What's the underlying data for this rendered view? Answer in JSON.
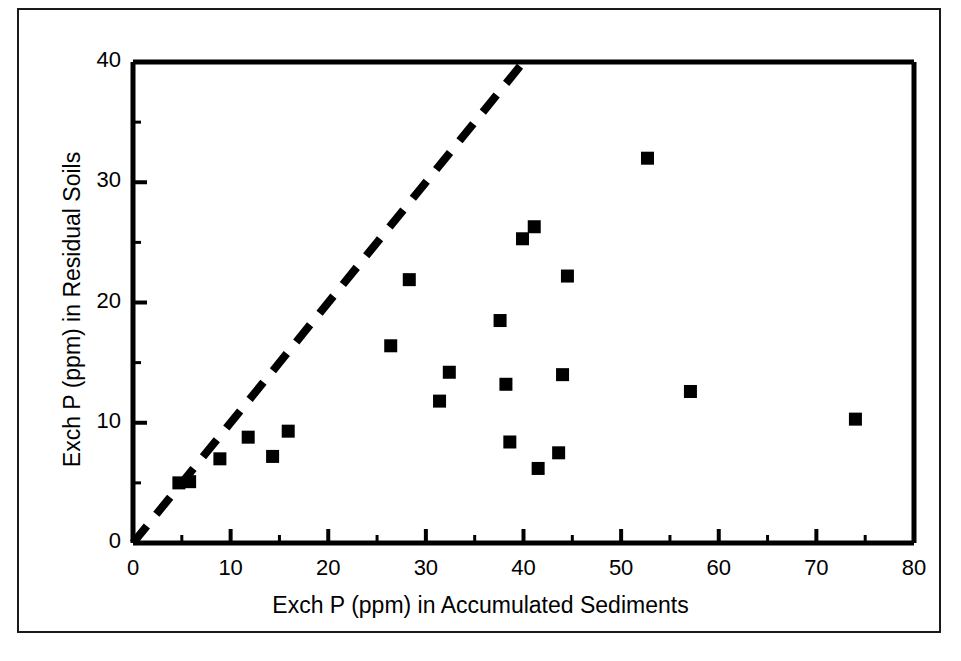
{
  "figure": {
    "background_color": "#ffffff",
    "ink_color": "#000000",
    "border_color": "#1a1a1a"
  },
  "chart_data": {
    "type": "scatter",
    "title": "",
    "xlabel": "Exch P (ppm) in Accumulated Sediments",
    "ylabel": "Exch P (ppm) in Residual Soils",
    "xlim": [
      0,
      80
    ],
    "ylim": [
      0,
      40
    ],
    "grid": false,
    "legend": null,
    "xticks": [
      0,
      10,
      20,
      30,
      40,
      50,
      60,
      70,
      80
    ],
    "xtick_labels": [
      "0",
      "10",
      "20",
      "30",
      "40",
      "50",
      "60",
      "70",
      "80"
    ],
    "x_minor_ticks": [
      5,
      15,
      25,
      35,
      45,
      55,
      65,
      75
    ],
    "yticks": [
      0,
      10,
      20,
      30,
      40
    ],
    "ytick_labels": [
      "0",
      "10",
      "20",
      "30",
      "40"
    ],
    "y_minor_ticks": [
      5,
      15,
      25,
      35
    ],
    "marker": "filled-square",
    "marker_color": "#000000",
    "points": [
      {
        "x": 4.7,
        "y": 5.0
      },
      {
        "x": 5.8,
        "y": 5.1
      },
      {
        "x": 8.9,
        "y": 7.0
      },
      {
        "x": 11.8,
        "y": 8.8
      },
      {
        "x": 14.3,
        "y": 7.2
      },
      {
        "x": 15.9,
        "y": 9.3
      },
      {
        "x": 26.4,
        "y": 16.4
      },
      {
        "x": 28.3,
        "y": 21.9
      },
      {
        "x": 31.4,
        "y": 11.8
      },
      {
        "x": 32.4,
        "y": 14.2
      },
      {
        "x": 37.6,
        "y": 18.5
      },
      {
        "x": 38.2,
        "y": 13.2
      },
      {
        "x": 38.6,
        "y": 8.4
      },
      {
        "x": 39.9,
        "y": 25.3
      },
      {
        "x": 41.1,
        "y": 26.3
      },
      {
        "x": 41.5,
        "y": 6.2
      },
      {
        "x": 43.6,
        "y": 7.5
      },
      {
        "x": 44.0,
        "y": 14.0
      },
      {
        "x": 44.5,
        "y": 22.2
      },
      {
        "x": 52.7,
        "y": 32.0
      },
      {
        "x": 57.1,
        "y": 12.6
      },
      {
        "x": 74.0,
        "y": 10.3
      }
    ],
    "reference_line": {
      "style": "dashed",
      "label": "1:1 line",
      "from": {
        "x": 0,
        "y": 0
      },
      "to": {
        "x": 40,
        "y": 40
      }
    }
  }
}
